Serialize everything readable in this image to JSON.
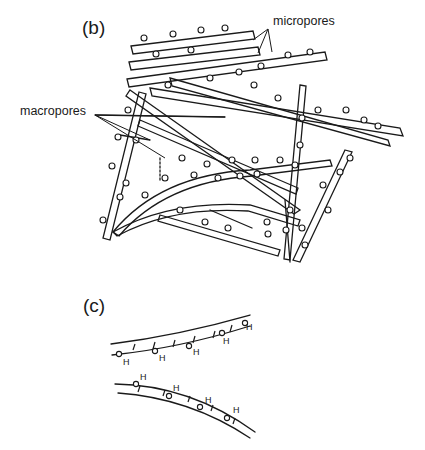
{
  "figure": {
    "panel_b": {
      "label": "(b)",
      "callouts": {
        "micropores": "micropores",
        "macropores": "macropores"
      }
    },
    "panel_c": {
      "label": "(c)",
      "atom_label": "H",
      "upper_chain_h_count": 5,
      "lower_chain_h_count": 4
    },
    "colors": {
      "ink": "#1a1a1a",
      "background": "#ffffff"
    }
  }
}
